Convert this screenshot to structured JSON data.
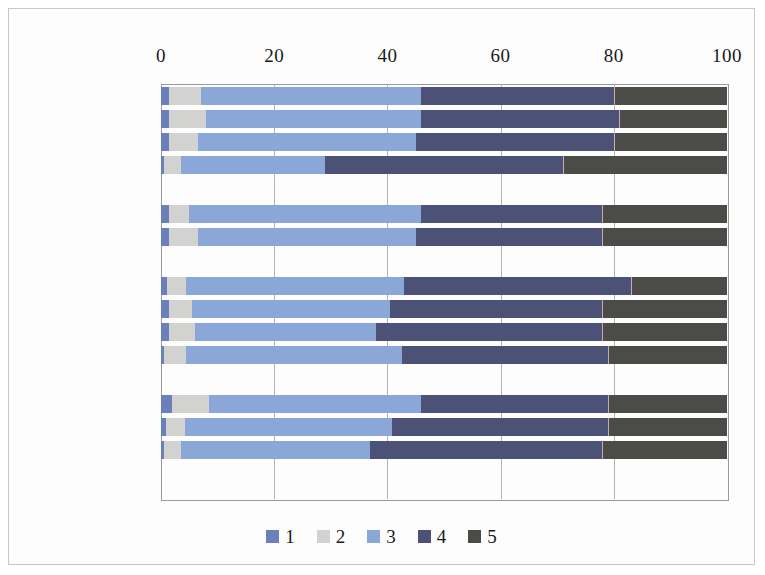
{
  "chart_data": {
    "type": "bar",
    "subtype": "100% stacked horizontal bar",
    "title": "",
    "xlabel": "",
    "ylabel": "",
    "xlim": [
      0,
      100
    ],
    "xticks": [
      0,
      20,
      40,
      60,
      80,
      100
    ],
    "xtick_labels": [
      "0",
      "20",
      "40",
      "60",
      "80",
      "100"
    ],
    "grid": true,
    "grid_axis": "x",
    "legend_position": "bottom",
    "orientation": "horizontal",
    "series": [
      {
        "name": "1",
        "color": "#6b7fba",
        "values": [
          1.5,
          1.5,
          1.5,
          0.5,
          1.5,
          1.5,
          1.0,
          1.5,
          1.5,
          0.5,
          2.0,
          0.8,
          0.5
        ]
      },
      {
        "name": "2",
        "color": "#d2d2d0",
        "values": [
          5.5,
          6.5,
          5.0,
          3.0,
          3.5,
          5.0,
          3.5,
          4.0,
          4.5,
          4.0,
          6.5,
          3.5,
          3.0
        ]
      },
      {
        "name": "3",
        "color": "#8aa7d8",
        "values": [
          39.0,
          38.0,
          38.5,
          25.5,
          41.0,
          38.5,
          38.5,
          35.0,
          32.0,
          38.0,
          37.5,
          36.5,
          33.5
        ]
      },
      {
        "name": "4",
        "color": "#4c5176",
        "values": [
          34.0,
          35.0,
          35.0,
          42.0,
          32.0,
          33.0,
          40.0,
          37.5,
          40.0,
          36.5,
          33.0,
          38.2,
          41.0
        ]
      },
      {
        "name": "5",
        "color": "#4b4b47",
        "values": [
          20.0,
          19.0,
          20.0,
          29.0,
          22.0,
          22.0,
          17.0,
          22.0,
          22.0,
          21.0,
          21.0,
          21.0,
          22.0
        ]
      }
    ],
    "groups": [
      {
        "name": "age",
        "categories": [
          "18—29岁",
          "30—39岁",
          "40—54岁",
          "55—69岁"
        ]
      },
      {
        "name": "gender",
        "categories": [
          "男性",
          "女性"
        ]
      },
      {
        "name": "settlement",
        "categories": [
          "布拉格",
          "大城市",
          "其他城镇",
          "农村"
        ]
      },
      {
        "name": "education",
        "categories": [
          "初等教育",
          "中等教育",
          "高等教育"
        ]
      }
    ],
    "categories": [
      "18—29岁",
      "30—39岁",
      "40—54岁",
      "55—69岁",
      "男性",
      "女性",
      "布拉格",
      "大城市",
      "其他城镇",
      "农村",
      "初等教育",
      "中等教育",
      "高等教育"
    ]
  },
  "legend": {
    "items": [
      {
        "label": "1",
        "color": "#6b7fba"
      },
      {
        "label": "2",
        "color": "#d2d2d0"
      },
      {
        "label": "3",
        "color": "#8aa7d8"
      },
      {
        "label": "4",
        "color": "#4c5176"
      },
      {
        "label": "5",
        "color": "#4b4b47"
      }
    ]
  }
}
